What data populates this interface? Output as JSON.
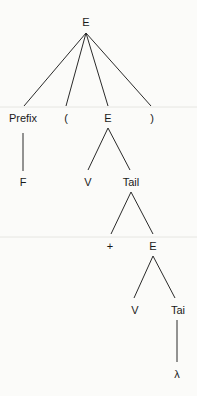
{
  "diagram": {
    "type": "parse-tree",
    "nodes": [
      {
        "id": "n0",
        "label": "E",
        "x": 86,
        "y": 22
      },
      {
        "id": "n1",
        "label": "Prefix",
        "x": 23,
        "y": 118
      },
      {
        "id": "n2",
        "label": "(",
        "x": 66,
        "y": 118
      },
      {
        "id": "n3",
        "label": "E",
        "x": 108,
        "y": 118
      },
      {
        "id": "n4",
        "label": ")",
        "x": 152,
        "y": 118
      },
      {
        "id": "n5",
        "label": "F",
        "x": 23,
        "y": 182
      },
      {
        "id": "n6",
        "label": "V",
        "x": 88,
        "y": 182
      },
      {
        "id": "n7",
        "label": "Tail",
        "x": 131,
        "y": 182
      },
      {
        "id": "n8",
        "label": "+",
        "x": 110,
        "y": 246
      },
      {
        "id": "n9",
        "label": "E",
        "x": 153,
        "y": 246
      },
      {
        "id": "n10",
        "label": "V",
        "x": 135,
        "y": 310
      },
      {
        "id": "n11",
        "label": "Tai",
        "x": 178,
        "y": 310
      },
      {
        "id": "n12",
        "label": "λ",
        "x": 177,
        "y": 374
      }
    ],
    "edges": [
      [
        "n0",
        "n1"
      ],
      [
        "n0",
        "n2"
      ],
      [
        "n0",
        "n3"
      ],
      [
        "n0",
        "n4"
      ],
      [
        "n1",
        "n5"
      ],
      [
        "n3",
        "n6"
      ],
      [
        "n3",
        "n7"
      ],
      [
        "n7",
        "n8"
      ],
      [
        "n7",
        "n9"
      ],
      [
        "n9",
        "n10"
      ],
      [
        "n9",
        "n11"
      ],
      [
        "n11",
        "n12"
      ]
    ]
  }
}
